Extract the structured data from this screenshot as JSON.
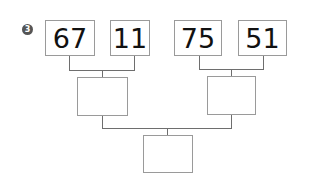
{
  "problem": {
    "marker": "3",
    "top_numbers": [
      "67",
      "11",
      "75",
      "51"
    ],
    "middle_answers": [
      "",
      ""
    ],
    "bottom_answer": ""
  },
  "colors": {
    "box_border": "#9a9a9a",
    "line": "#6e6e6e",
    "marker_bg": "#555555",
    "text": "#111111"
  }
}
